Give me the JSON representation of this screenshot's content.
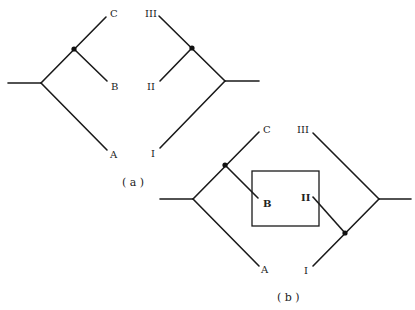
{
  "diagram_a": {
    "caption": "( a )",
    "left_tree": {
      "labels": {
        "C": "C",
        "B": "B",
        "A": "A"
      }
    },
    "right_tree": {
      "labels": {
        "III": "III",
        "II": "II",
        "I": "I"
      }
    }
  },
  "diagram_b": {
    "caption": "( b )",
    "left_tree": {
      "labels": {
        "C": "C",
        "B": "B",
        "A": "A"
      }
    },
    "right_tree": {
      "labels": {
        "III": "III",
        "II": "II",
        "I": "I"
      }
    },
    "box": "highlight-rectangle"
  },
  "colors": {
    "line": "#1a1a1a",
    "background": "#ffffff"
  }
}
